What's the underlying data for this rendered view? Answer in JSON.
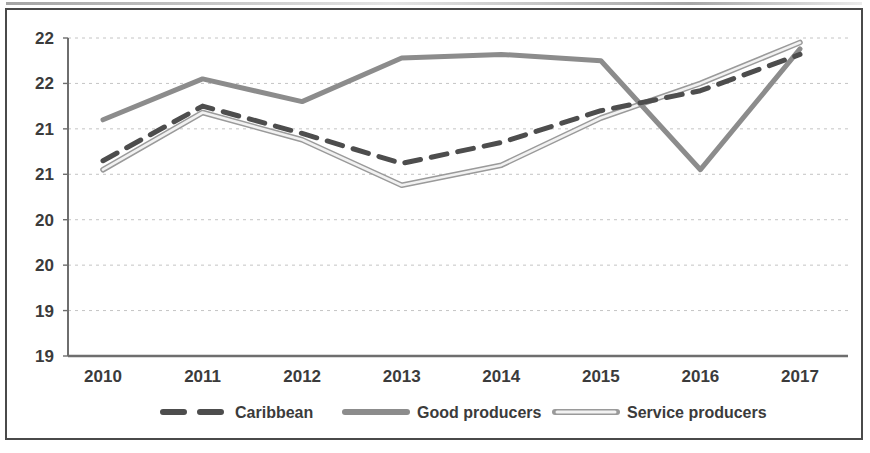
{
  "chart_data": {
    "type": "line",
    "title": "",
    "subtitle": "",
    "xlabel": "",
    "ylabel": "",
    "categories": [
      "2010",
      "2011",
      "2012",
      "2013",
      "2014",
      "2015",
      "2016",
      "2017"
    ],
    "x_tick_labels": [
      "2010",
      "2011",
      "2012",
      "2013",
      "2014",
      "2015",
      "2016",
      "2017"
    ],
    "y_tick_labels": [
      "22",
      "22",
      "21",
      "21",
      "20",
      "20",
      "19",
      "19"
    ],
    "y_tick_values": [
      22.0,
      21.5,
      21.0,
      20.5,
      20.0,
      19.5,
      19.0,
      18.5
    ],
    "ylim": [
      18.5,
      22.0
    ],
    "grid": true,
    "grid_style": "dotted-horizontal",
    "legend_position": "bottom",
    "series": [
      {
        "name": "Caribbean",
        "style": "dashed",
        "color": "#4d4d4d",
        "width": 5,
        "values": [
          20.65,
          21.25,
          20.95,
          20.62,
          20.85,
          21.2,
          21.42,
          21.82
        ]
      },
      {
        "name": "Good producers",
        "style": "solid",
        "color": "#8c8c8c",
        "width": 5,
        "values": [
          21.1,
          21.55,
          21.3,
          21.78,
          21.82,
          21.75,
          20.55,
          21.88
        ]
      },
      {
        "name": "Service producers",
        "style": "outline",
        "color": "#c9c9c9",
        "width": 4,
        "values": [
          20.55,
          21.18,
          20.88,
          20.38,
          20.6,
          21.12,
          21.5,
          21.95
        ]
      }
    ]
  },
  "legend": {
    "items": [
      {
        "label": "Caribbean",
        "marker": "dashed-line-marker"
      },
      {
        "label": "Good producers",
        "marker": "solid-line-marker"
      },
      {
        "label": "Service producers",
        "marker": "outline-line-marker"
      }
    ]
  },
  "colors": {
    "frame": "#4a4a4a",
    "axis": "#6e6e6e",
    "grid": "#c4c4c4",
    "text": "#3b3b3b",
    "caribbean": "#4d4d4d",
    "good_producers": "#8c8c8c",
    "service_producers": "#c9c9c9"
  }
}
